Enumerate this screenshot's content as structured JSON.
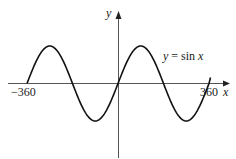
{
  "chart_data": {
    "type": "line",
    "title": "",
    "xlabel": "x",
    "ylabel": "y",
    "xlim": [
      -360,
      360
    ],
    "ylim": [
      -1,
      1
    ],
    "grid": false,
    "legend": "none",
    "tick_labels": {
      "x": [
        "-360",
        "360"
      ]
    },
    "annotations": [
      {
        "text": "y = sin x",
        "x": 150,
        "y": 0.8
      }
    ],
    "series": [
      {
        "name": "y = sin x",
        "x": [
          -360,
          -315,
          -270,
          -225,
          -180,
          -135,
          -90,
          -45,
          0,
          45,
          90,
          135,
          180,
          225,
          270,
          315,
          360
        ],
        "values": [
          0,
          0.707,
          1,
          0.707,
          0,
          -0.707,
          -1,
          -0.707,
          0,
          0.707,
          1,
          0.707,
          0,
          -0.707,
          -1,
          -0.707,
          0
        ]
      }
    ]
  },
  "labels": {
    "y_axis": "y",
    "x_axis": "x",
    "x_min": "−360",
    "x_max": "360",
    "curve_eq_lhs": "y",
    "curve_eq_mid": " = sin ",
    "curve_eq_rhs": "x"
  }
}
